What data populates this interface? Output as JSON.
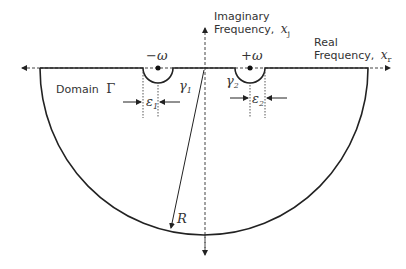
{
  "diagram": {
    "axes": {
      "imaginary_label_line1": "Imaginary",
      "imaginary_label_line2": "Frequency,",
      "imaginary_symbol": "x",
      "imaginary_subscript": "j",
      "real_label_line1": "Real",
      "real_label_line2": "Frequency,",
      "real_symbol": "x",
      "real_subscript": "r"
    },
    "domain_label": "Domain",
    "domain_symbol": "Γ",
    "poles": [
      {
        "label": "−ω"
      },
      {
        "label": "+ω"
      }
    ],
    "contours": [
      {
        "symbol": "γ",
        "subscript": "1"
      },
      {
        "symbol": "γ",
        "subscript": "2"
      }
    ],
    "epsilons": [
      {
        "symbol": "ε",
        "subscript": "1"
      },
      {
        "symbol": "ε",
        "subscript": "2"
      }
    ],
    "radius_label": "R",
    "colors": {
      "line": "#222222",
      "text": "#333333"
    }
  }
}
